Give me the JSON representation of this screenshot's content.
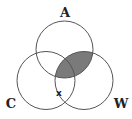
{
  "diagram": {
    "type": "venn-3",
    "sets": [
      {
        "id": "A",
        "label": "A",
        "cx": 64.5,
        "cy": 49.5,
        "r": 28.5
      },
      {
        "id": "C",
        "label": "C",
        "cx": 46,
        "cy": 80.5,
        "r": 29
      },
      {
        "id": "W",
        "label": "W",
        "cx": 84,
        "cy": 80.5,
        "r": 29
      }
    ],
    "shaded_region": {
      "description": "A ∩ W",
      "color": "#7a7a7a"
    },
    "marks": [
      {
        "symbol": "x",
        "region": "C ∩ W (not A)"
      }
    ],
    "colors": {
      "outline": "#555555",
      "shade": "#7a7a7a",
      "text": "#222222",
      "background": "#ffffff"
    }
  }
}
